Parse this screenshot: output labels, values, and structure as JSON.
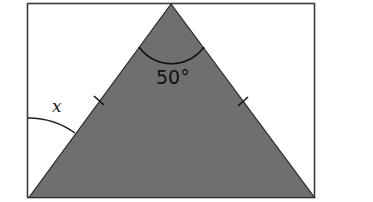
{
  "diagram": {
    "type": "geometry",
    "colors": {
      "background": "#ffffff",
      "triangle_fill": "#6f6f6f",
      "stroke": "#2a2a2a"
    },
    "labels": {
      "apex_angle": "50°",
      "unknown_angle": "x"
    },
    "marks": {
      "equal_side_ticks": 2,
      "angle_arcs": [
        "apex",
        "bottom-left exterior"
      ]
    }
  }
}
